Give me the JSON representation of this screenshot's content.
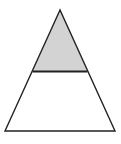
{
  "diagram": {
    "type": "triangle-partition",
    "canvas": {
      "width": 121,
      "height": 144,
      "background": "#ffffff"
    },
    "triangle": {
      "apex": [
        60,
        10
      ],
      "base_left": [
        5,
        131
      ],
      "base_right": [
        115,
        131
      ],
      "stroke": "#222222",
      "stroke_width": 1.4,
      "fill": "#ffffff"
    },
    "divider": {
      "y": 71.5,
      "x1": 32.6,
      "x2": 87.4,
      "stroke": "#222222",
      "stroke_width": 1.8
    },
    "shaded_region": {
      "fill": "#d3d3d3",
      "points": [
        [
          60,
          10
        ],
        [
          32.6,
          71.5
        ],
        [
          87.4,
          71.5
        ]
      ]
    }
  }
}
